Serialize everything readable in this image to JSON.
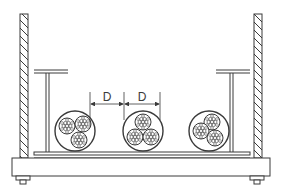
{
  "diagram": {
    "type": "engineering-cross-section",
    "colors": {
      "stroke": "#3a3a3a",
      "background": "#ffffff",
      "fill": "#ffffff"
    },
    "dimensions": [
      {
        "label": "D",
        "from_x": 90,
        "to_x": 124
      },
      {
        "label": "D",
        "from_x": 124,
        "to_x": 160
      }
    ],
    "cables": [
      {
        "name": "cable-bundle-left",
        "cx": 75,
        "cy": 131,
        "r": 20,
        "cores": 3
      },
      {
        "name": "cable-bundle-middle",
        "cx": 143,
        "cy": 131,
        "r": 20,
        "cores": 3
      },
      {
        "name": "cable-bundle-right",
        "cx": 209,
        "cy": 131,
        "r": 20,
        "cores": 3
      }
    ],
    "components": [
      "left-wall",
      "right-wall",
      "left-support-post",
      "right-support-post",
      "cable-tray",
      "base-plate",
      "left-bolt",
      "right-bolt"
    ]
  }
}
